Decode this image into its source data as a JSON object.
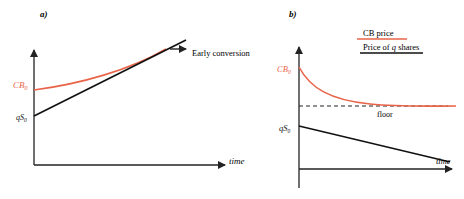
{
  "colors": {
    "cb_curve": "#e8654a",
    "share_line": "#111111",
    "axis": "#222222",
    "label_red": "#e8654a"
  },
  "panel_a": {
    "tag": "a)",
    "y_label_cb": "CB",
    "y_label_cb_sub": "0",
    "y_label_qs": "qS",
    "y_label_qs_sub": "0",
    "annotation": "Early conversion",
    "x_label": "time"
  },
  "panel_b": {
    "tag": "b)",
    "legend": [
      {
        "label": "CB price",
        "color": "#e8654a"
      },
      {
        "label_pre": "Price of ",
        "label_var": "q",
        "label_post": " shares",
        "color": "#111111"
      }
    ],
    "y_label_cb": "CB",
    "y_label_cb_sub": "0",
    "y_label_qs": "qS",
    "y_label_qs_sub": "0",
    "floor_label": "floor",
    "x_label": "time"
  }
}
